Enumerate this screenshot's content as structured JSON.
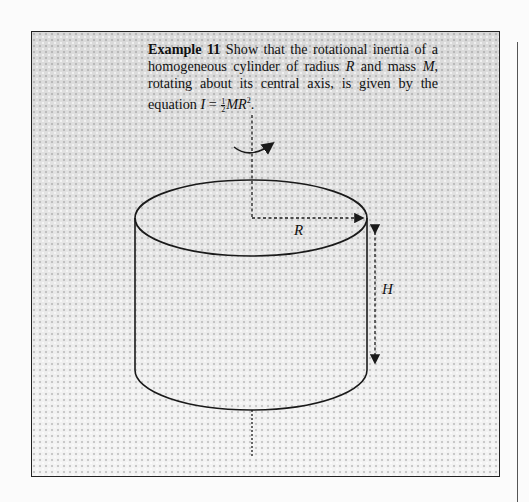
{
  "example": {
    "lead": "Example 11",
    "text_part1": " Show that the rotational inertia of a homogeneous cylinder of radius ",
    "var_R": "R",
    "text_part2": " and mass ",
    "var_M": "M",
    "text_part3": ", rotating about its central axis, is given by the equation ",
    "eq_I": "I",
    "eq_equals": " = ",
    "frac_num": "1",
    "frac_den": "2",
    "eq_MR": "MR",
    "eq_exp": "2",
    "eq_end": "."
  },
  "figure": {
    "radius_label": "R",
    "height_label": "H",
    "rotation_arrow": "curved-arrow-icon",
    "line_color": "#1a1a1a"
  }
}
